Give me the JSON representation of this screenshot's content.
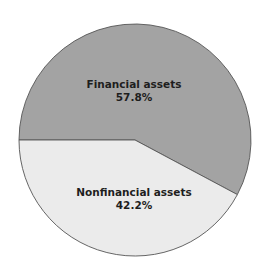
{
  "chart_data": {
    "type": "pie",
    "title": "",
    "categories": [
      "Financial assets",
      "Nonfinancial assets"
    ],
    "values": [
      57.8,
      42.2
    ],
    "unit": "%",
    "labels": [
      {
        "name": "Financial assets",
        "value_text": "57.8%"
      },
      {
        "name": "Nonfinancial assets",
        "value_text": "42.2%"
      }
    ],
    "colors": [
      "#a3a3a3",
      "#ebebeb"
    ],
    "start_angle_deg": 180,
    "direction": "clockwise",
    "legend": "none",
    "grid": false
  },
  "slices": [
    {
      "label": "Financial assets",
      "value_text": "57.8%",
      "color": "#a3a3a3"
    },
    {
      "label": "Nonfinancial assets",
      "value_text": "42.2%",
      "color": "#ebebeb"
    }
  ],
  "stroke_color": "#555555"
}
